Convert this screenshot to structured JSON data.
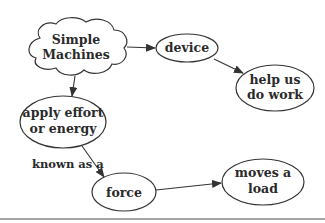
{
  "diagram": {
    "type": "concept-map",
    "nodes": [
      {
        "id": "simple_machines",
        "shape": "cloud",
        "lines": [
          "Simple",
          "Machines"
        ]
      },
      {
        "id": "device",
        "shape": "ellipse",
        "lines": [
          "device"
        ]
      },
      {
        "id": "help_us_do_work",
        "shape": "ellipse",
        "lines": [
          "help us",
          "do work"
        ]
      },
      {
        "id": "apply_effort",
        "shape": "ellipse",
        "lines": [
          "apply effort",
          "or energy"
        ]
      },
      {
        "id": "force",
        "shape": "ellipse",
        "lines": [
          "force"
        ]
      },
      {
        "id": "moves_a_load",
        "shape": "ellipse",
        "lines": [
          "moves a",
          "load"
        ]
      }
    ],
    "edges": [
      {
        "from": "simple_machines",
        "to": "device",
        "label": ""
      },
      {
        "from": "device",
        "to": "help_us_do_work",
        "label": ""
      },
      {
        "from": "simple_machines",
        "to": "apply_effort",
        "label": ""
      },
      {
        "from": "apply_effort",
        "to": "force",
        "label": "known as a"
      },
      {
        "from": "force",
        "to": "moves_a_load",
        "label": ""
      }
    ],
    "colors": {
      "stroke": "#333333",
      "text": "#2a2a2a",
      "background": "#ffffff",
      "rule": "#888888"
    }
  }
}
